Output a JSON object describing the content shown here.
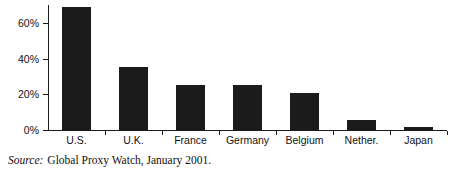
{
  "chart_data": {
    "type": "bar",
    "title": "",
    "subtitle": "",
    "xlabel": "",
    "ylabel": "",
    "categories": [
      "U.S.",
      "U.K.",
      "France",
      "Germany",
      "Belgium",
      "Nether.",
      "Japan"
    ],
    "values": [
      69,
      35.5,
      25,
      25,
      21,
      5.5,
      1.5
    ],
    "value_labels": [
      "69%",
      "35.5%",
      "25%",
      "25%",
      "21%",
      "5.5%",
      "1.5%"
    ],
    "ylim": [
      0,
      70
    ],
    "ytick_values": [
      0,
      20,
      40,
      60
    ],
    "ytick_labels": [
      "0%",
      "20%",
      "40%",
      "60%"
    ],
    "grid": false,
    "legend": null,
    "bar_color": "#1b1b1b",
    "axis_color": "#1a1a1a",
    "annotations": [
      "Source:  Global Proxy Watch, January 2001."
    ]
  },
  "figure": {
    "source_label": "Source:",
    "source_text": "Global Proxy Watch, January 2001."
  }
}
